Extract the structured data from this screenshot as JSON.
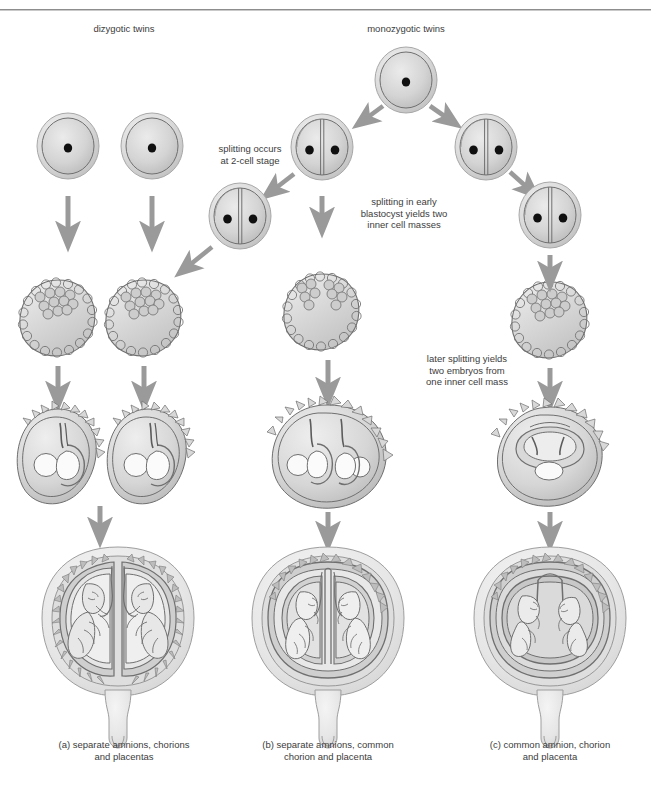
{
  "figure": {
    "title_top_left": "dizygotic twins",
    "title_top_right": "monozygotic twins",
    "header_ghost": "",
    "annotations": [
      {
        "id": "splitting-2cell",
        "text": "splitting occurs\nat 2-cell stage"
      },
      {
        "id": "splitting-blastocyst",
        "text": "splitting in early\nblastocyst yields two\ninner cell masses"
      },
      {
        "id": "later-splitting",
        "text": "later splitting yields\ntwo embryos from\none inner cell mass"
      }
    ],
    "captions": [
      {
        "tag": "(a)",
        "text": "separate amnions, chorions\nand placentas"
      },
      {
        "tag": "(b)",
        "text": "separate amnions, common\nchorion and placenta"
      },
      {
        "tag": "(c)",
        "text": "common amnion, chorion\nand placenta"
      }
    ],
    "colors": {
      "outline": "#6f6f6f",
      "cell_fill_light": "#e8e8e8",
      "cell_fill_mid": "#d2d2d2",
      "cell_fill_dark": "#b4b4b4",
      "nucleus": "#101010",
      "arrow": "#9a9a9a",
      "text": "#3c3c3c",
      "background": "#ffffff"
    },
    "stages": {
      "zygote": "zygote",
      "two_cell": "two-cell stage",
      "blastocyst": "blastocyst",
      "implantation": "implanted embryo",
      "uterus": "uterus with twins"
    }
  }
}
